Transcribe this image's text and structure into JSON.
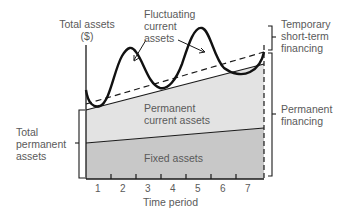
{
  "diagram": {
    "y_axis_label_line1": "Total assets",
    "y_axis_label_line2": "($)",
    "x_axis_label": "Time period",
    "x_ticks": [
      "1",
      "2",
      "3",
      "4",
      "5",
      "6",
      "7"
    ],
    "regions": {
      "fluctuating_line1": "Fluctuating",
      "fluctuating_line2": "current",
      "fluctuating_line3": "assets",
      "permanent_current_line1": "Permanent",
      "permanent_current_line2": "current assets",
      "fixed": "Fixed assets"
    },
    "right_labels": {
      "temporary_line1": "Temporary",
      "temporary_line2": "short-term",
      "temporary_line3": "financing",
      "permanent_line1": "Permanent",
      "permanent_line2": "financing"
    },
    "left_labels": {
      "total_permanent_line1": "Total",
      "total_permanent_line2": "permanent",
      "total_permanent_line3": "assets"
    },
    "colors": {
      "fixed_fill": "#c8c8c8",
      "permanent_current_fill": "#e2e2e2",
      "line": "#1a1a1a",
      "text": "#5a5a5a"
    }
  }
}
